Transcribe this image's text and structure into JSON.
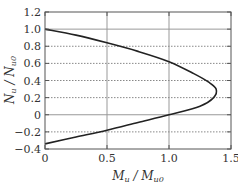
{
  "chart_data": {
    "type": "line",
    "title": "",
    "xlabel": "M_u / M_u0",
    "ylabel": "N_u / N_u0",
    "xlim": [
      0,
      1.5
    ],
    "ylim": [
      -0.4,
      1.2
    ],
    "x_ticks": [
      0,
      0.5,
      1.0,
      1.5
    ],
    "x_tick_labels": [
      "0",
      "0.5",
      "1.0",
      "1.5"
    ],
    "y_ticks": [
      -0.4,
      -0.2,
      0,
      0.2,
      0.4,
      0.6,
      0.8,
      1.0,
      1.2
    ],
    "y_tick_labels": [
      "−0.4",
      "−0.2",
      "0",
      "0.2",
      "0.4",
      "0.6",
      "0.8",
      "1.0",
      "1.2"
    ],
    "grid": {
      "vertical_solid": [
        0.5,
        1.0
      ],
      "horizontal_solid": [
        0,
        1.0
      ],
      "horizontal_dotted": [
        -0.2,
        0.2,
        0.4,
        0.6,
        0.8
      ]
    },
    "legend": null,
    "series": [
      {
        "name": "interaction curve",
        "color": "#222222",
        "points": [
          {
            "x": 0.0,
            "y": 1.0
          },
          {
            "x": 0.25,
            "y": 0.93
          },
          {
            "x": 0.5,
            "y": 0.84
          },
          {
            "x": 0.75,
            "y": 0.74
          },
          {
            "x": 1.0,
            "y": 0.62
          },
          {
            "x": 1.2,
            "y": 0.48
          },
          {
            "x": 1.32,
            "y": 0.38
          },
          {
            "x": 1.38,
            "y": 0.3
          },
          {
            "x": 1.36,
            "y": 0.2
          },
          {
            "x": 1.25,
            "y": 0.1
          },
          {
            "x": 1.0,
            "y": 0.0
          },
          {
            "x": 0.75,
            "y": -0.09
          },
          {
            "x": 0.5,
            "y": -0.18
          },
          {
            "x": 0.25,
            "y": -0.26
          },
          {
            "x": 0.0,
            "y": -0.34
          }
        ]
      }
    ]
  },
  "labels": {
    "x_main": "M",
    "x_sub1": "u",
    "x_sep": " / ",
    "x_main2": "M",
    "x_sub2": "u0",
    "y_main": "N",
    "y_sub1": "u",
    "y_sep": " / ",
    "y_main2": "N",
    "y_sub2": "u0"
  },
  "colors": {
    "frame": "#555555",
    "grid_solid": "#999999",
    "grid_dotted": "#888888",
    "curve": "#222222"
  }
}
